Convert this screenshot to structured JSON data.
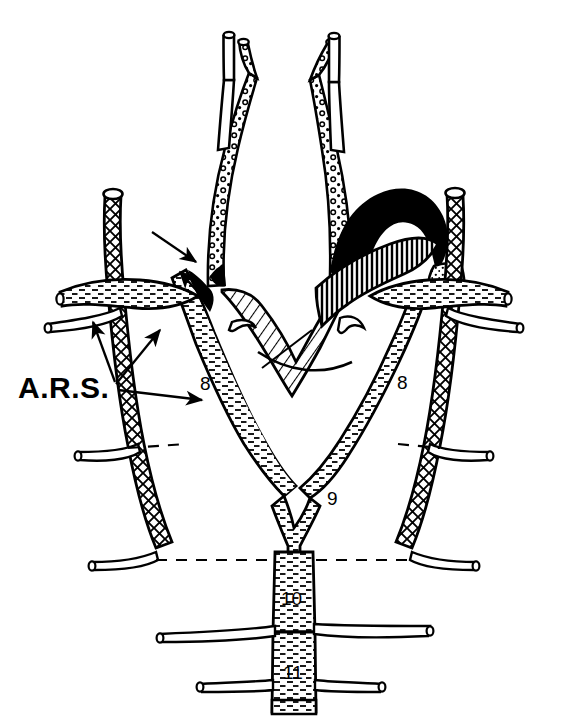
{
  "figure": {
    "background_color": "#ffffff",
    "line_color": "#000000",
    "width": 569,
    "height": 722
  },
  "labels": {
    "ars": "A.R.S.",
    "segment_left_8": "8",
    "segment_right_8": "8",
    "segment_9": "9",
    "segment_10": "10",
    "segment_11": "11"
  },
  "annotations": {
    "leader_arrows_count": 5,
    "dashed_levels": 2,
    "arrow_targets": [
      "left-vertebral-crosshatch",
      "left-subclavian-junction",
      "left-aortic-arch-segment-8",
      "left-arch-black-wedge-upper",
      "left-arch-black-wedge-lower"
    ]
  },
  "patterns": {
    "circle_stipple": "carotid-arteries",
    "diagonal_hatch": "ascending-aorta",
    "vertical_hatch": "pulmonary-artery",
    "comb_hatch": "aortic-arch-descending",
    "cross_hatch": "vertebral-arteries",
    "dash_stipple": "subclavian-arteries",
    "fine_dot_stipple": "right-arch-origin",
    "solid_black": "ductus-and-arch-lumen"
  },
  "colors": {
    "ink": "#000000",
    "paper": "#ffffff"
  }
}
